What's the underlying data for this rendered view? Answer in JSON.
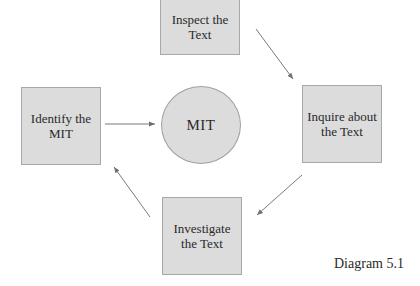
{
  "diagram": {
    "nodes": {
      "inspect": {
        "label_line1": "Inspect the",
        "label_line2": "Text"
      },
      "inquire": {
        "label_line1": "Inquire about",
        "label_line2": "the Text"
      },
      "investigate": {
        "label_line1": "Investigate",
        "label_line2": "the Text"
      },
      "identify": {
        "label_line1": "Identify the",
        "label_line2": "MIT"
      },
      "center": {
        "label": "MIT"
      }
    },
    "edges": [
      {
        "from": "inspect",
        "to": "inquire"
      },
      {
        "from": "inquire",
        "to": "investigate"
      },
      {
        "from": "investigate",
        "to": "identify"
      },
      {
        "from": "identify",
        "to": "center"
      }
    ],
    "caption": "Diagram 5.1",
    "colors": {
      "fill": "#dcdcdc",
      "border": "#a8a8a8",
      "arrow": "#707070"
    }
  }
}
